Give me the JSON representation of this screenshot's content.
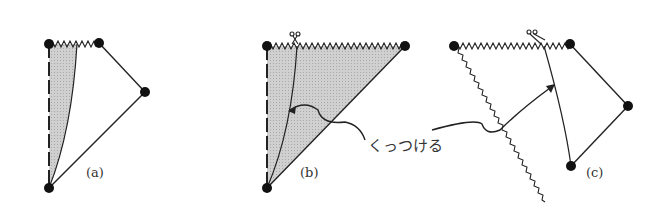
{
  "panels": [
    {
      "id": "a",
      "label": "(a)"
    },
    {
      "id": "b",
      "label": "(b)"
    },
    {
      "id": "c",
      "label": "(c)"
    }
  ],
  "annotation": {
    "text": "くっつける"
  },
  "colors": {
    "shade": "#c8c8c8",
    "line": "#222222",
    "dot": "#111111"
  }
}
